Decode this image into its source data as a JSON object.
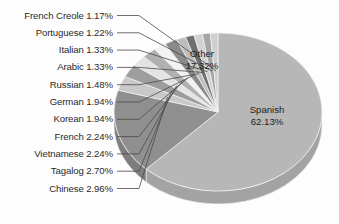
{
  "chart_data": {
    "type": "pie",
    "title": "",
    "subtitle": "",
    "xlabel": "",
    "ylabel": "",
    "legend_position": "none",
    "grid": false,
    "units": "percent",
    "style": "3d-pie-grayscale",
    "categories": [
      "Spanish",
      "Other",
      "Chinese",
      "Tagalog",
      "Vietnamese",
      "French",
      "Korean",
      "German",
      "Russian",
      "Arabic",
      "Italian",
      "Portuguese",
      "French Creole"
    ],
    "values": [
      62.13,
      17.32,
      2.96,
      2.7,
      2.24,
      2.24,
      1.94,
      1.94,
      1.48,
      1.33,
      1.33,
      1.22,
      1.17
    ],
    "slices": [
      {
        "label": "Spanish",
        "value": 62.13,
        "value_text": "62.13%",
        "color": "#b7b7b7",
        "side_color": "#a3a3a3",
        "callout": "inside"
      },
      {
        "label": "Other",
        "value": 17.32,
        "value_text": "17.32%",
        "color": "#8f8f8f",
        "side_color": "#7e7e7e",
        "callout": "inside"
      },
      {
        "label": "Chinese",
        "value": 2.96,
        "value_text": "2.96%",
        "color": "#c9c9c9",
        "side_color": "#b4b4b4",
        "callout": "leader"
      },
      {
        "label": "Tagalog",
        "value": 2.7,
        "value_text": "2.70%",
        "color": "#9d9d9d",
        "side_color": "#8b8b8b",
        "callout": "leader"
      },
      {
        "label": "Vietnamese",
        "value": 2.24,
        "value_text": "2.24%",
        "color": "#e4e4e4",
        "side_color": "#cccccc",
        "callout": "leader"
      },
      {
        "label": "French",
        "value": 2.24,
        "value_text": "2.24%",
        "color": "#b0b0b0",
        "side_color": "#9c9c9c",
        "callout": "leader"
      },
      {
        "label": "Korean",
        "value": 1.94,
        "value_text": "1.94%",
        "color": "#f2f2f2",
        "side_color": "#d8d8d8",
        "callout": "leader"
      },
      {
        "label": "German",
        "value": 1.94,
        "value_text": "1.94%",
        "color": "#8a8a8a",
        "side_color": "#787878",
        "callout": "leader"
      },
      {
        "label": "Russian",
        "value": 1.48,
        "value_text": "1.48%",
        "color": "#bdbdbd",
        "side_color": "#a8a8a8",
        "callout": "leader"
      },
      {
        "label": "Arabic",
        "value": 1.33,
        "value_text": "1.33%",
        "color": "#6f6f6f",
        "side_color": "#616161",
        "callout": "leader"
      },
      {
        "label": "Italian",
        "value": 1.33,
        "value_text": "1.33%",
        "color": "#d2d2d2",
        "side_color": "#bbbbbb",
        "callout": "leader"
      },
      {
        "label": "Portuguese",
        "value": 1.22,
        "value_text": "1.22%",
        "color": "#a5a5a5",
        "side_color": "#929292",
        "callout": "leader"
      },
      {
        "label": "French Creole",
        "value": 1.17,
        "value_text": "1.17%",
        "color": "#cfcfcf",
        "side_color": "#b8b8b8",
        "callout": "leader"
      }
    ]
  },
  "labels": {
    "leader_items": [
      {
        "text": "French Creole 1.17%"
      },
      {
        "text": "Portuguese 1.22%"
      },
      {
        "text": "Italian 1.33%"
      },
      {
        "text": "Arabic 1.33%"
      },
      {
        "text": "Russian 1.48%"
      },
      {
        "text": "German 1.94%"
      },
      {
        "text": "Korean 1.94%"
      },
      {
        "text": "French 2.24%"
      },
      {
        "text": "Vietnamese 2.24%"
      },
      {
        "text": "Tagalog 2.70%"
      },
      {
        "text": "Chinese 2.96%"
      }
    ],
    "callouts": [
      {
        "name": "Other",
        "value_text": "17.32%"
      },
      {
        "name": "Spanish",
        "value_text": "62.13%"
      }
    ]
  },
  "colors": {
    "background": "#fdfdfd",
    "label_text": "#2b2b2b",
    "callout_text": "#1e1e1e",
    "leader_line": "#4a4a4a",
    "slice_outline": "#f4f4f4"
  }
}
